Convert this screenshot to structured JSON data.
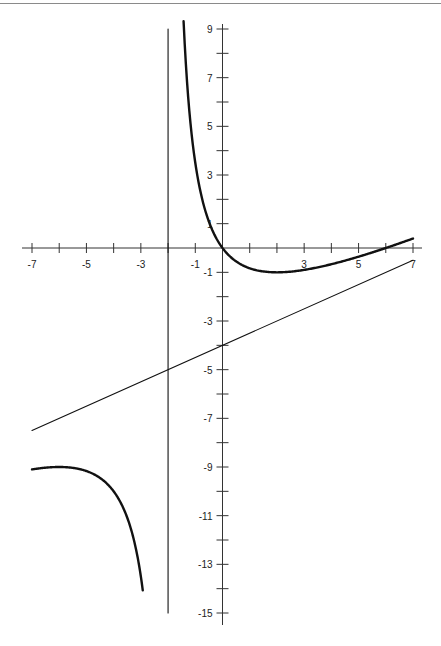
{
  "chart_data": {
    "type": "line",
    "title": "",
    "xlabel": "",
    "ylabel": "",
    "xlim": [
      -7,
      7
    ],
    "ylim": [
      -15,
      9
    ],
    "grid": false,
    "x_ticks": [
      -7,
      -6,
      -5,
      -4,
      -3,
      -2,
      -1,
      0,
      1,
      2,
      3,
      4,
      5,
      6,
      7
    ],
    "x_tick_labels": [
      {
        "value": -7,
        "label": "-7"
      },
      {
        "value": -5,
        "label": "-5"
      },
      {
        "value": -3,
        "label": "-3"
      },
      {
        "value": -1,
        "label": "-1"
      },
      {
        "value": 3,
        "label": "3"
      },
      {
        "value": 5,
        "label": "5"
      },
      {
        "value": 7,
        "label": "7"
      }
    ],
    "y_ticks": [
      -15,
      -14,
      -13,
      -12,
      -11,
      -10,
      -9,
      -8,
      -7,
      -6,
      -5,
      -4,
      -3,
      -2,
      -1,
      0,
      1,
      2,
      3,
      4,
      5,
      6,
      7,
      8,
      9
    ],
    "y_tick_labels": [
      {
        "value": 9,
        "label": "9"
      },
      {
        "value": 7,
        "label": "7"
      },
      {
        "value": 5,
        "label": "5"
      },
      {
        "value": 3,
        "label": "3"
      },
      {
        "value": 1,
        "label": "1"
      },
      {
        "value": -1,
        "label": "-1"
      },
      {
        "value": -3,
        "label": "-3"
      },
      {
        "value": -5,
        "label": "-5"
      },
      {
        "value": -7,
        "label": "-7"
      },
      {
        "value": -9,
        "label": "-9"
      },
      {
        "value": -11,
        "label": "-11"
      },
      {
        "value": -13,
        "label": "-13"
      },
      {
        "value": -15,
        "label": "-15"
      }
    ],
    "series": [
      {
        "name": "f(x) = x/2 - 4 + 8/(x+2), right branch",
        "style": "thick",
        "points": [
          [
            -1.43,
            9
          ],
          [
            -1.2,
            5.4
          ],
          [
            -1,
            3.5
          ],
          [
            -0.75,
            2.03
          ],
          [
            -0.5,
            0.95
          ],
          [
            0,
            0
          ],
          [
            0.5,
            -0.55
          ],
          [
            1,
            -0.83
          ],
          [
            1.5,
            -0.96
          ],
          [
            2,
            -1
          ],
          [
            2.5,
            -0.97
          ],
          [
            3,
            -0.9
          ],
          [
            4,
            -0.67
          ],
          [
            5,
            -0.36
          ],
          [
            6,
            0
          ],
          [
            7,
            0.39
          ]
        ]
      },
      {
        "name": "f(x) = x/2 - 4 + 8/(x+2), left branch",
        "style": "thick",
        "points": [
          [
            -7,
            -9.1
          ],
          [
            -6.5,
            -9.03
          ],
          [
            -6,
            -9
          ],
          [
            -5.5,
            -9.04
          ],
          [
            -5,
            -9.17
          ],
          [
            -4.5,
            -9.45
          ],
          [
            -4,
            -10
          ],
          [
            -3.7,
            -10.56
          ],
          [
            -3.5,
            -11.08
          ],
          [
            -3.3,
            -11.8
          ],
          [
            -3.1,
            -13.82
          ],
          [
            -2.93,
            -15
          ]
        ]
      },
      {
        "name": "oblique asymptote y = x/2 - 4",
        "style": "thin",
        "points": [
          [
            -7,
            -7.5
          ],
          [
            7,
            -0.5
          ]
        ]
      },
      {
        "name": "vertical asymptote x = -2",
        "style": "thin",
        "points": [
          [
            -2,
            9
          ],
          [
            -2,
            -15
          ]
        ]
      }
    ]
  }
}
